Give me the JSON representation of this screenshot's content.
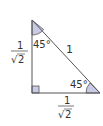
{
  "diagram": {
    "type": "right-isosceles-triangle",
    "colors": {
      "stroke": "#555555",
      "angle_fill": "#c9cbe6",
      "text": "#333333"
    },
    "angles": {
      "top": "45°",
      "bottom_right": "45°",
      "right_angle_marker": true
    },
    "sides": {
      "hypotenuse": "1",
      "vertical_leg": {
        "numerator": "1",
        "denominator": "2",
        "radical": "√"
      },
      "horizontal_leg": {
        "numerator": "1",
        "denominator": "2",
        "radical": "√"
      }
    }
  }
}
